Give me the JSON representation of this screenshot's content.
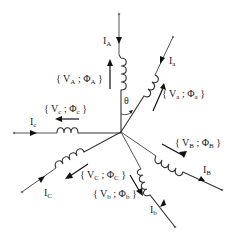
{
  "diagram": {
    "type": "six-phase star winding diagram",
    "center": {
      "x": 121,
      "y": 132
    },
    "angle_label": "θ",
    "branches": [
      {
        "id": "A",
        "current": {
          "main": "I",
          "sub": "A"
        },
        "voltage_flux": {
          "open": "{ V",
          "vsub": "A",
          "sep": " ; Φ",
          "fsub": "A",
          "close": " }"
        }
      },
      {
        "id": "a",
        "current": {
          "main": "I",
          "sub": "a"
        },
        "voltage_flux": {
          "open": "{ V",
          "vsub": "a",
          "sep": " ; Φ",
          "fsub": "a",
          "close": " }"
        }
      },
      {
        "id": "c",
        "current": {
          "main": "I",
          "sub": "c"
        },
        "voltage_flux": {
          "open": "{ V",
          "vsub": "c",
          "sep": " ; Φ",
          "fsub": "c",
          "close": " }"
        }
      },
      {
        "id": "C",
        "current": {
          "main": "I",
          "sub": "C"
        },
        "voltage_flux": {
          "open": "{ V",
          "vsub": "C",
          "sep": " ; Φ",
          "fsub": "C",
          "close": " }"
        }
      },
      {
        "id": "b",
        "current": {
          "main": "I",
          "sub": "b"
        },
        "voltage_flux": {
          "open": "{ V",
          "vsub": "b",
          "sep": " ; Φ",
          "fsub": "b",
          "close": " }"
        }
      },
      {
        "id": "B",
        "current": {
          "main": "I",
          "sub": "B"
        },
        "voltage_flux": {
          "open": "{ V",
          "vsub": "B",
          "sep": " ; Φ",
          "fsub": "B",
          "close": " }"
        }
      }
    ]
  }
}
